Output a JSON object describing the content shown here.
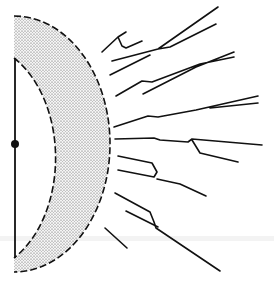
{
  "figure": {
    "type": "schematic",
    "colors": {
      "line": "#111111",
      "stipple": "#555555",
      "background": "#ffffff"
    },
    "center_point": {
      "x": 14,
      "y": 144
    },
    "inner_radius": 88,
    "outer_radius": 100,
    "ray_count": 12
  }
}
